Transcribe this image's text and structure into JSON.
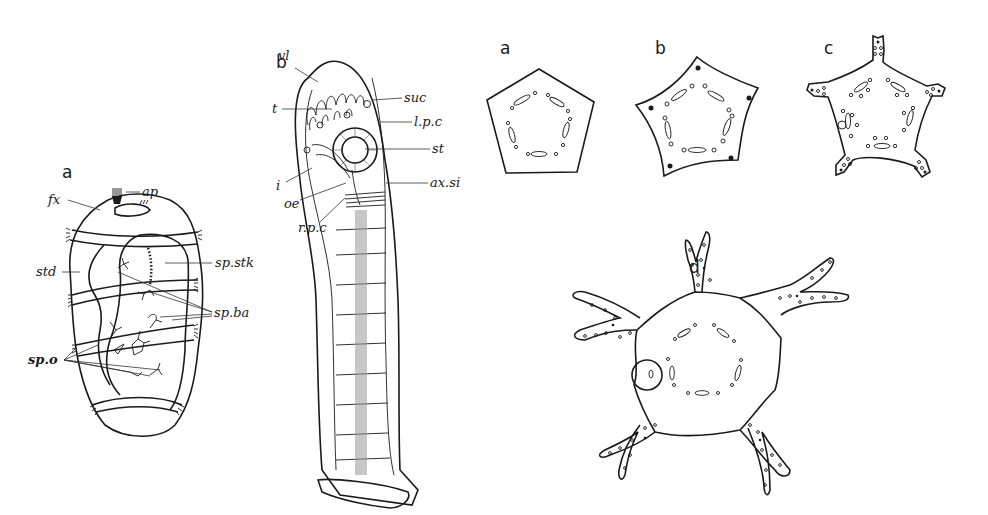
{
  "figure": {
    "left_group": {
      "panel_a": {
        "letter": "a",
        "labels": {
          "ap": "ap",
          "fx": "fx",
          "std": "std",
          "sp_stk": "sp.stk",
          "sp_ba": "sp.ba",
          "sp_o": "sp.o"
        }
      },
      "panel_b": {
        "letter": "b",
        "labels": {
          "vl": "vl",
          "t": "t",
          "suc": "suc",
          "l_p_c": "l.p.c",
          "st": "st",
          "i": "i",
          "ax_si": "ax.si",
          "oe": "oe",
          "r_p_c": "r.p.c"
        }
      }
    },
    "right_group": {
      "panels": [
        {
          "letter": "a",
          "shape": "pentagon"
        },
        {
          "letter": "b",
          "shape": "concave-pentagon"
        },
        {
          "letter": "c",
          "shape": "five-armed-star"
        },
        {
          "letter": "d",
          "shape": "rounded-body-with-forked-arms"
        }
      ]
    },
    "colors": {
      "ink": "#1a1a1a",
      "background": "#ffffff"
    }
  }
}
